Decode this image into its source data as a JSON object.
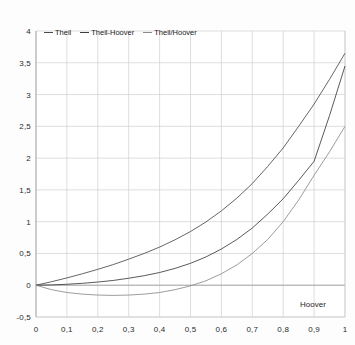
{
  "chart_data": {
    "type": "line",
    "title": "",
    "xlabel": "Hoover",
    "ylabel": "",
    "xlim": [
      0,
      1
    ],
    "ylim": [
      -0.5,
      4
    ],
    "grid": true,
    "legend_position": "top-left-inside",
    "x_tick_labels": [
      "0",
      "0,1",
      "0,2",
      "0,3",
      "0,4",
      "0,5",
      "0,6",
      "0,7",
      "0,8",
      "0,9",
      "1"
    ],
    "x_tick_values": [
      0,
      0.1,
      0.2,
      0.3,
      0.4,
      0.5,
      0.6,
      0.7,
      0.8,
      0.9,
      1
    ],
    "y_tick_labels": [
      "4",
      "3,5",
      "3",
      "2,5",
      "2",
      "1,5",
      "1",
      "0,5",
      "0",
      "-0,5"
    ],
    "y_tick_values": [
      4,
      3.5,
      3,
      2.5,
      2,
      1.5,
      1,
      0.5,
      0,
      -0.5
    ],
    "x": [
      0,
      0.05,
      0.1,
      0.15,
      0.2,
      0.25,
      0.3,
      0.35,
      0.4,
      0.45,
      0.5,
      0.55,
      0.6,
      0.65,
      0.7,
      0.75,
      0.8,
      0.85,
      0.9,
      0.95,
      1
    ],
    "series": [
      {
        "name": "Theil",
        "color": "#4a4a4a",
        "values": [
          0,
          0.055,
          0.115,
          0.18,
          0.25,
          0.325,
          0.41,
          0.5,
          0.6,
          0.715,
          0.845,
          0.995,
          1.17,
          1.37,
          1.6,
          1.87,
          2.16,
          2.5,
          2.85,
          3.24,
          3.65
        ]
      },
      {
        "name": "Theil-Hoover",
        "color": "#3c3c3c",
        "values": [
          0,
          0.005,
          0.015,
          0.03,
          0.05,
          0.075,
          0.11,
          0.15,
          0.2,
          0.265,
          0.345,
          0.445,
          0.57,
          0.72,
          0.9,
          1.12,
          1.36,
          1.65,
          1.95,
          2.67,
          3.45
        ]
      },
      {
        "name": "Theil/Hoover",
        "color": "#8a8a8a",
        "values": [
          0,
          -0.07,
          -0.115,
          -0.14,
          -0.155,
          -0.16,
          -0.155,
          -0.14,
          -0.115,
          -0.07,
          -0.01,
          0.07,
          0.18,
          0.32,
          0.5,
          0.72,
          1.0,
          1.34,
          1.73,
          2.1,
          2.5
        ]
      }
    ]
  },
  "legend": {
    "items": [
      {
        "label": "Theil"
      },
      {
        "label": "Theil-Hoover"
      },
      {
        "label": "Theil/Hoover"
      }
    ]
  },
  "axis": {
    "x_title": "Hoover"
  }
}
